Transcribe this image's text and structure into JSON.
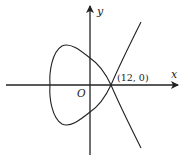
{
  "figure": {
    "axes": {
      "x_label": "x",
      "y_label": "y",
      "origin_label": "O"
    },
    "point_labels": [
      {
        "text": "(12, 0)",
        "x": 12,
        "y": 0
      }
    ],
    "colors": {
      "stroke": "#222222",
      "background": "#ffffff"
    }
  }
}
